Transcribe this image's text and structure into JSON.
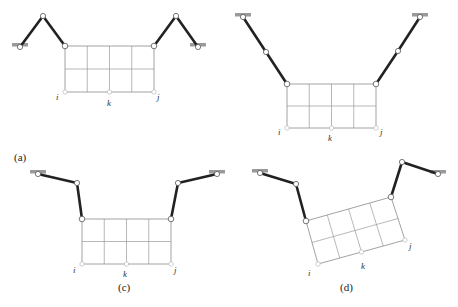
{
  "figure": {
    "colors": {
      "bar": "#222222",
      "grid": "#8a8a8a",
      "anchor": "#9a9a9a",
      "node": "#ffffff"
    },
    "node_labels": {
      "i": "i",
      "k": "k",
      "j": "j"
    },
    "panels": [
      {
        "id": "a",
        "label": "(a)",
        "label_pos": [
          14,
          161
        ],
        "grid": {
          "tl": [
            65,
            46
          ],
          "tr": [
            154,
            46
          ],
          "br": [
            154,
            92
          ],
          "bl": [
            65,
            92
          ],
          "cols": 4,
          "rows": 2
        },
        "left_chain": {
          "anchor": [
            20,
            47
          ],
          "mid": [
            43,
            16
          ],
          "end": [
            65,
            46
          ]
        },
        "right_chain": {
          "anchor": [
            198,
            47
          ],
          "mid": [
            176,
            16
          ],
          "end": [
            154,
            46
          ]
        },
        "labels": {
          "i": [
            56,
            100
          ],
          "k": [
            107,
            106
          ],
          "j": [
            157,
            100
          ]
        }
      },
      {
        "id": "b",
        "label": "",
        "label_pos": [
          0,
          0
        ],
        "grid": {
          "tl": [
            287,
            84
          ],
          "tr": [
            376,
            84
          ],
          "br": [
            376,
            128
          ],
          "bl": [
            287,
            128
          ],
          "cols": 4,
          "rows": 2
        },
        "left_chain": {
          "anchor": [
            243,
            17
          ],
          "mid": [
            266,
            52
          ],
          "end": [
            287,
            84
          ]
        },
        "right_chain": {
          "anchor": [
            420,
            17
          ],
          "mid": [
            398,
            51
          ],
          "end": [
            376,
            84
          ]
        },
        "labels": {
          "i": [
            278,
            135
          ],
          "k": [
            328,
            141
          ],
          "j": [
            380,
            135
          ]
        }
      },
      {
        "id": "c",
        "label": "(c)",
        "label_pos": [
          118,
          291
        ],
        "grid": {
          "tl": [
            82,
            219
          ],
          "tr": [
            171,
            219
          ],
          "br": [
            171,
            264
          ],
          "bl": [
            82,
            264
          ],
          "cols": 4,
          "rows": 2
        },
        "left_chain": {
          "anchor": [
            38,
            174
          ],
          "mid": [
            77,
            183
          ],
          "end": [
            82,
            219
          ]
        },
        "right_chain": {
          "anchor": [
            217,
            174
          ],
          "mid": [
            178,
            183
          ],
          "end": [
            171,
            219
          ]
        },
        "labels": {
          "i": [
            73,
            273
          ],
          "k": [
            123,
            277
          ],
          "j": [
            174,
            273
          ]
        }
      },
      {
        "id": "d",
        "label": "(d)",
        "label_pos": [
          340,
          291
        ],
        "grid": {
          "tl": [
            306,
            221
          ],
          "tr": [
            391,
            197
          ],
          "br": [
            405,
            240
          ],
          "bl": [
            318,
            264
          ],
          "cols": 4,
          "rows": 2
        },
        "left_chain": {
          "anchor": [
            260,
            173
          ],
          "mid": [
            296,
            184
          ],
          "end": [
            306,
            221
          ]
        },
        "right_chain": {
          "anchor": [
            438,
            174
          ],
          "mid": [
            402,
            162
          ],
          "end": [
            391,
            197
          ]
        },
        "labels": {
          "i": [
            308,
            276
          ],
          "k": [
            361,
            269
          ],
          "j": [
            409,
            249
          ]
        }
      }
    ]
  }
}
